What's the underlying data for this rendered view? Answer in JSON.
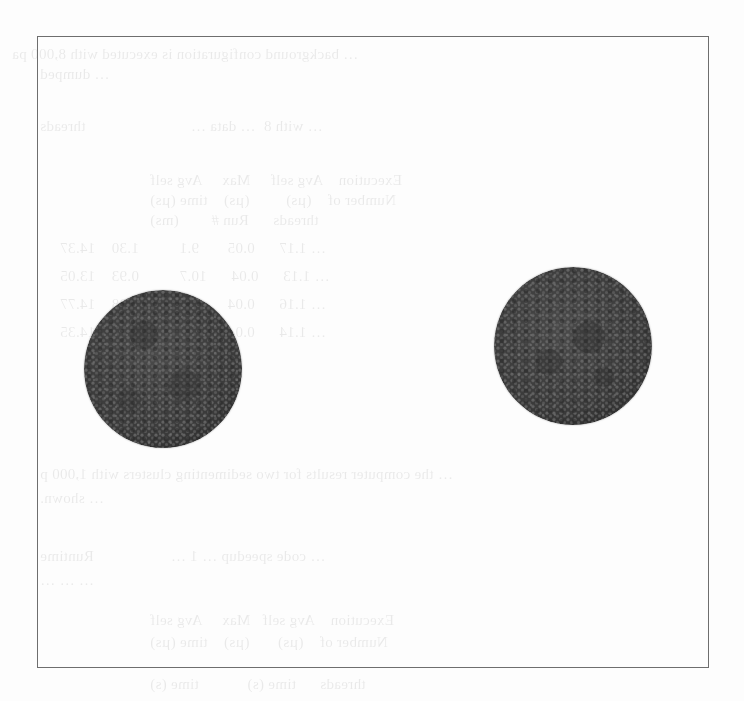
{
  "figure": {
    "frame": {
      "left": 37,
      "top": 36,
      "right": 709,
      "bottom": 668,
      "border_color": "#6e6e6e"
    },
    "spheres": [
      {
        "id": "left-particle-cluster",
        "cx": 163,
        "cy": 369,
        "r": 79,
        "base_color": "#3c3c3c",
        "speck_color": "#6c6c6c"
      },
      {
        "id": "right-particle-cluster",
        "cx": 573,
        "cy": 346,
        "r": 79,
        "base_color": "#3c3c3c",
        "speck_color": "#6c6c6c"
      }
    ]
  },
  "bleed_through": {
    "lines": [
      "… background configuration is executed with 8,000 pa",
      "… dumped",
      "… with 8  … data …                          threads",
      "          Execution    Avg self     Max     Avg self",
      "          Number of    (µs)         (µs)    time (µs)",
      "          threads      Run #        (ms)",
      "… 1.17      0.05       9.1          1.30    14.37",
      "… 1.13      0.04      10.7          0.93    13.05",
      "… 1.16      0.04       9.6          1.28    14.77",
      "… 1.14      0.04       9.6          1.27    14.35",
      "… the computer results for two sedimenting clusters with 1,000 p",
      "… shown.",
      "… code speedup … 1 …                   Runtime",
      "… … …",
      "          Execution    Avg self   Max     Avg self",
      "          Number of    (µs)       (µs)    time (µs)",
      "          threads      time (s)            time (s)"
    ]
  }
}
